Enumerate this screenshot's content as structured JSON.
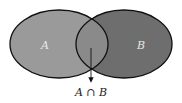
{
  "diagram": {
    "type": "venn",
    "sets": [
      {
        "label": "A",
        "fill": "#9a9a9a"
      },
      {
        "label": "B",
        "fill": "#6e6e6e"
      }
    ],
    "intersection": {
      "label": "A ∩ B",
      "fill": "#8a8a8a"
    },
    "outline_color": "#111111",
    "label_color": "#e8e8e8",
    "background": "#ffffff"
  }
}
